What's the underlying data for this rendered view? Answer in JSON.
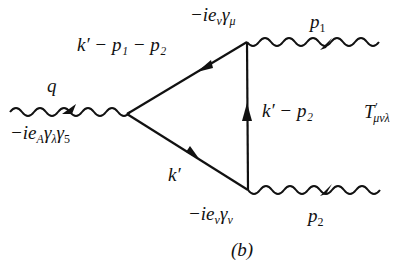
{
  "diagram": {
    "type": "feynman-triangle",
    "vertices": {
      "left": {
        "x": 127,
        "y": 114
      },
      "top": {
        "x": 247,
        "y": 42
      },
      "bottom": {
        "x": 248,
        "y": 190
      }
    },
    "colors": {
      "line": "#111111",
      "background": "#ffffff"
    }
  },
  "labels": {
    "q": "q",
    "axial_vertex": {
      "pre": "−ie",
      "sub1": "A",
      "g1": "γ",
      "sub2": "λ",
      "g2": "γ",
      "sub3": "5"
    },
    "top_vertex": {
      "pre": "−ie",
      "sub1": "v",
      "g": "γ",
      "sub2": "μ"
    },
    "bottom_vertex": {
      "pre": "−ie",
      "sub1": "v",
      "g": "γ",
      "sub2": "ν"
    },
    "p1": {
      "p": "p",
      "sub": "1"
    },
    "p2": {
      "p": "p",
      "sub": "2"
    },
    "upper_fermion": "k′ − p₁ − p₂",
    "vertical_fermion": "k′ − p₂",
    "lower_fermion": "k′",
    "amplitude": {
      "T": "T",
      "prime": "′",
      "sub": "μνλ"
    },
    "caption": "(b)"
  }
}
